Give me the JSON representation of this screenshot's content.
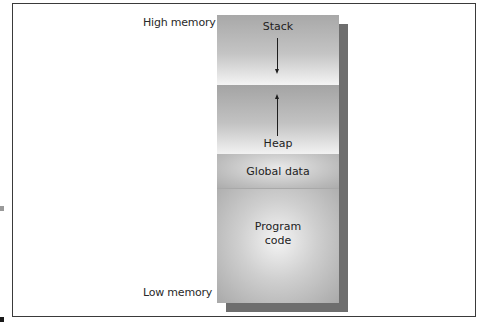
{
  "diagram": {
    "type": "memory-layout",
    "labels": {
      "high": "High memory",
      "low": "Low memory"
    },
    "segments": [
      {
        "id": "stack",
        "label": "Stack",
        "growth": "down"
      },
      {
        "id": "heap",
        "label": "Heap",
        "growth": "up"
      },
      {
        "id": "global",
        "label": "Global data"
      },
      {
        "id": "code",
        "label": "Program\ncode"
      }
    ],
    "colors": {
      "frame": "#3a3a3a",
      "shadow": "#6e6e6e",
      "segment_dark": "#a8a8a8",
      "segment_light": "#f4f4f4"
    }
  }
}
